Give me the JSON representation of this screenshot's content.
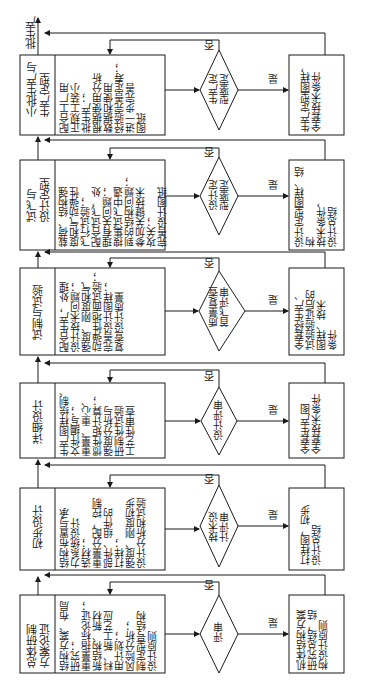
{
  "output_label": "批生产",
  "yes_label": "是",
  "no_label": "否",
  "stages": [
    {
      "name": "总体研制\n方案论证",
      "tasks": "结构方案、布局\n研究；\n重量指标论证；\n新结构、新材\n料、新工艺应\n用计划；\n风险分析；\n制定型号结构\n设计原则",
      "decision": "评审",
      "output": "机体结构方案\n研究总结，结\n构设计原则"
    },
    {
      "name": "初步设计",
      "tasks": "结构布置与承\n力系统设计\n选材；\n重量分配，控制\n部件、组件的\n打样；\n强度、刚度初步\n设计分析和试验",
      "decision": "技术设\n计评审",
      "output": "打样图，初步\n设计总结"
    },
    {
      "name": "详细设计",
      "tasks": "生产图样绘制、\n文件编写；\n重量、重心、\n惯性矩计算；\n强度分析与\n研制性试验\n工艺性审查",
      "decision": "设计评审",
      "output": "全套生产图\n全套技术条件"
    },
    {
      "name": "试制与试验",
      "tasks": "配合生产，处理\n设计技术问题；\n强度、刚度和气\n动弹性地面试验；\n完善设计图样；\n复查设计质量",
      "decision": "质量复查\n首飞评审",
      "output": "全套经生产、\n试验验证后的\n图样、技术\n条件"
    },
    {
      "name": "试飞与\n设计定型",
      "tasks": "载荷、结构强\n度和气动弹性\n飞行试验；\n配合试飞，处\n理有关问题；\n搜集试飞中遇\n到的结构问题；\n参加关键技术\n攻关；\n完善设计图纸",
      "decision": "设计定\n型鉴定",
      "output": "设计定型图样、结构\n技术条件，\n设计总结"
    },
    {
      "name": "小批生产与\n生产定型",
      "tasks": "配合工厂用\n正规工装小\n批生产；\n根据使用分析\n数据和使用\n经验完善定寿；\n进一步完善\n图纸",
      "decision": "生产定\n型鉴定",
      "output": "生产定型图样，\n全套技术条件"
    }
  ]
}
